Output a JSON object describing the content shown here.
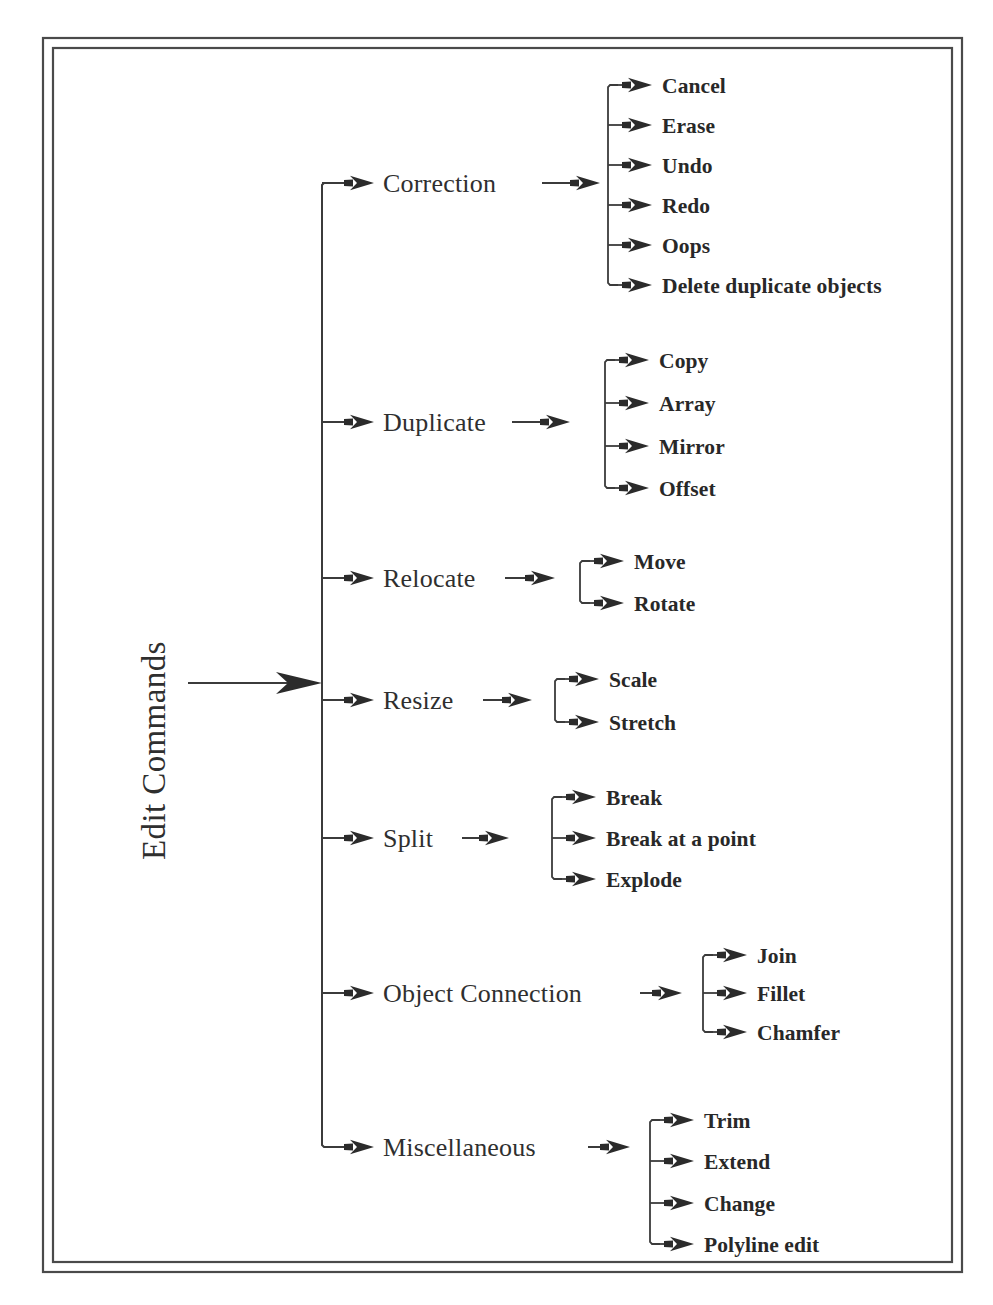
{
  "figure": {
    "root_label": "Edit Commands",
    "background_color": "#ffffff",
    "line_color": "#3b3b3b",
    "frame_color": "#4a4a4a",
    "text_color": "#2f2f2f"
  },
  "tree": {
    "root": "Edit Commands",
    "branches": [
      {
        "label": "Correction",
        "children": [
          "Cancel",
          "Erase",
          "Undo",
          "Redo",
          "Oops",
          "Delete duplicate objects"
        ]
      },
      {
        "label": "Duplicate",
        "children": [
          "Copy",
          "Array",
          "Mirror",
          "Offset"
        ]
      },
      {
        "label": "Relocate",
        "children": [
          "Move",
          "Rotate"
        ]
      },
      {
        "label": "Resize",
        "children": [
          "Scale",
          "Stretch"
        ]
      },
      {
        "label": "Split",
        "children": [
          "Break",
          "Break at a point",
          "Explode"
        ]
      },
      {
        "label": "Object Connection",
        "children": [
          "Join",
          "Fillet",
          "Chamfer"
        ]
      },
      {
        "label": "Miscellaneous",
        "children": [
          "Trim",
          "Extend",
          "Change",
          "Polyline edit"
        ]
      }
    ]
  },
  "labels": {
    "b0": "Correction",
    "b0c0": "Cancel",
    "b0c1": "Erase",
    "b0c2": "Undo",
    "b0c3": "Redo",
    "b0c4": "Oops",
    "b0c5": "Delete duplicate objects",
    "b1": "Duplicate",
    "b1c0": "Copy",
    "b1c1": "Array",
    "b1c2": "Mirror",
    "b1c3": "Offset",
    "b2": "Relocate",
    "b2c0": "Move",
    "b2c1": "Rotate",
    "b3": "Resize",
    "b3c0": "Scale",
    "b3c1": "Stretch",
    "b4": "Split",
    "b4c0": "Break",
    "b4c1": "Break at a point",
    "b4c2": "Explode",
    "b5": "Object Connection",
    "b5c0": "Join",
    "b5c1": "Fillet",
    "b5c2": "Chamfer",
    "b6": "Miscellaneous",
    "b6c0": "Trim",
    "b6c1": "Extend",
    "b6c2": "Change",
    "b6c3": "Polyline edit"
  }
}
